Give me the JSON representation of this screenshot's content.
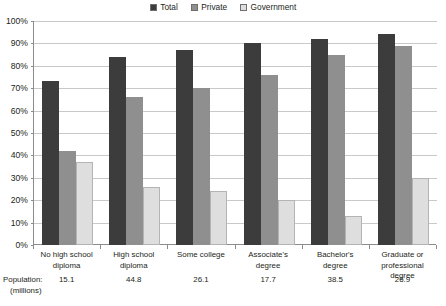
{
  "legend": {
    "entries": [
      {
        "label": "Total",
        "color": "#3c3c3c"
      },
      {
        "label": "Private",
        "color": "#8f8f8f"
      },
      {
        "label": "Government",
        "color": "#dedede"
      }
    ]
  },
  "population_row": {
    "caption_line1": "Population:",
    "caption_line2": "(millions)",
    "values": [
      "15.1",
      "44.8",
      "26.1",
      "17.7",
      "38.5",
      "26.9"
    ]
  },
  "yaxis": {
    "ticks": [
      "0%",
      "10%",
      "20%",
      "30%",
      "40%",
      "50%",
      "60%",
      "70%",
      "80%",
      "90%",
      "100%"
    ]
  },
  "chart_data": {
    "type": "bar",
    "title": "",
    "xlabel": "",
    "ylabel": "",
    "ylim": [
      0,
      100
    ],
    "ytick_step": 10,
    "grid": true,
    "legend_position": "top-center",
    "categories": [
      "No high school diploma",
      "High school diploma",
      "Some college",
      "Associate's degree",
      "Bachelor's degree",
      "Graduate or professional degree"
    ],
    "category_lines": [
      [
        "No high school",
        "diploma"
      ],
      [
        "High school",
        "diploma"
      ],
      [
        "Some college"
      ],
      [
        "Associate's",
        "degree"
      ],
      [
        "Bachelor's",
        "degree"
      ],
      [
        "Graduate or",
        "professional degree"
      ]
    ],
    "series": [
      {
        "name": "Total",
        "color": "#3c3c3c",
        "values": [
          73,
          84,
          87,
          90,
          92,
          94
        ]
      },
      {
        "name": "Private",
        "color": "#8f8f8f",
        "values": [
          42,
          66,
          70,
          76,
          85,
          89
        ]
      },
      {
        "name": "Government",
        "color": "#dedede",
        "values": [
          37,
          26,
          24,
          20,
          13,
          30
        ]
      }
    ],
    "population_millions": [
      15.1,
      44.8,
      26.1,
      17.7,
      38.5,
      26.9
    ]
  }
}
